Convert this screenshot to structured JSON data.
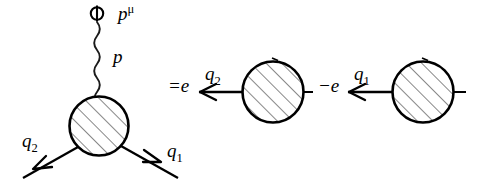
{
  "figure": {
    "background_color": "#ffffff",
    "ink_color": "#000000",
    "width": 494,
    "height": 185
  },
  "labels": {
    "photon_momentum_index": "p",
    "photon_momentum_index_sup": "μ",
    "photon_momentum": "p",
    "quark2_left": "q",
    "quark2_left_sub": "2",
    "quark1_left": "q",
    "quark1_left_sub": "1",
    "equals_charge": "=e",
    "quark2_mid": "q",
    "quark2_mid_sub": "2",
    "minus_charge": "−e",
    "quark1_right": "q",
    "quark1_right_sub": "1"
  },
  "blobs": [
    {
      "name": "vertex-blob-left",
      "cx": 99,
      "cy": 126,
      "r": 30,
      "hatched": true
    },
    {
      "name": "vertex-blob-mid",
      "cx": 273,
      "cy": 92,
      "r": 31,
      "hatched": true
    },
    {
      "name": "vertex-blob-right",
      "cx": 423,
      "cy": 92,
      "r": 31,
      "hatched": true
    }
  ],
  "icons": {
    "photon_vertex": "circled-cross-icon",
    "photon_line": "wavy-photon-line-icon",
    "fermion_arrow": "arrowhead-icon",
    "hatch_fill": "diagonal-hatch-icon"
  }
}
